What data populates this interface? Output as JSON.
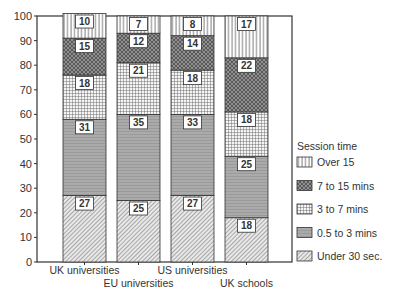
{
  "chart_data": {
    "type": "bar",
    "stacked": true,
    "title": "",
    "xlabel": "",
    "ylabel": "",
    "ylim": [
      0,
      100
    ],
    "yticks": [
      0,
      10,
      20,
      30,
      40,
      50,
      60,
      70,
      80,
      90,
      100
    ],
    "grid": false,
    "legend_position": "right",
    "legend_title": "Session time",
    "categories": [
      "UK universities",
      "EU universities",
      "US universities",
      "UK schools"
    ],
    "series": [
      {
        "name": "Under 30 sec.",
        "pattern": "diagonal-hatch",
        "values": [
          27,
          25,
          27,
          18
        ]
      },
      {
        "name": "0.5 to 3 mins",
        "pattern": "horizontal-lines-gray",
        "values": [
          31,
          35,
          33,
          25
        ]
      },
      {
        "name": "3 to 7 mins",
        "pattern": "grid",
        "values": [
          18,
          21,
          18,
          18
        ]
      },
      {
        "name": "7 to 15 mins",
        "pattern": "dark-crosshatch",
        "values": [
          15,
          12,
          14,
          22
        ]
      },
      {
        "name": "Over 15",
        "pattern": "vertical-lines",
        "values": [
          10,
          7,
          8,
          17
        ]
      }
    ],
    "legend_order": [
      "Over 15",
      "7 to 15 mins",
      "3 to 7 mins",
      "0.5 to 3 mins",
      "Under 30 sec."
    ]
  }
}
